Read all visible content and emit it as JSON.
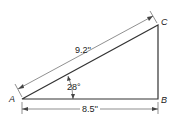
{
  "diagram": {
    "type": "right-triangle",
    "vertices": {
      "A": "A",
      "B": "B",
      "C": "C"
    },
    "right_angle_at": "B",
    "hypotenuse_label": "9.2''",
    "base_label": "8.5''",
    "angle_label": "28°",
    "colors": {
      "line": "#333333",
      "background": "#ffffff"
    }
  }
}
